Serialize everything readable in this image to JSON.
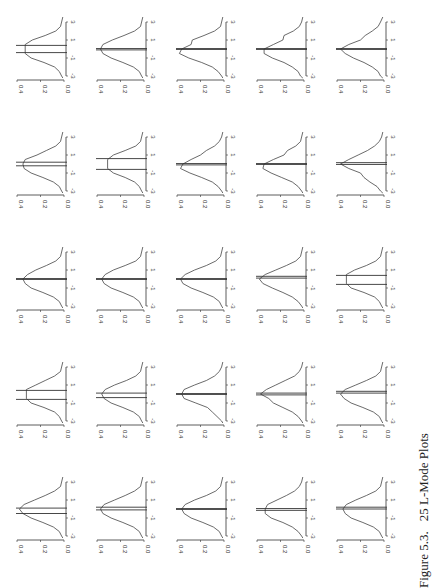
{
  "page": {
    "orientation": "rotated-90-ccw",
    "caption": {
      "figure_number": "Figure 5.3.",
      "title": "25 L-Mode Plots"
    }
  },
  "chart_data": {
    "type": "line",
    "title": "25 L-Mode Plots",
    "layout": "5x5 grid of small density plots with interval lines",
    "xlabel": "",
    "ylabel": "",
    "x_ticks": [
      "-3",
      "-1",
      "1",
      "3"
    ],
    "y_ticks": [
      "0.0",
      "0.2",
      "0.4"
    ],
    "xlim": [
      -3,
      3
    ],
    "ylim": [
      0,
      0.4
    ],
    "grid": false,
    "x_grid_points": [
      -3,
      -2.5,
      -2,
      -1.5,
      -1,
      -0.5,
      0,
      0.5,
      1,
      1.5,
      2,
      2.5,
      3
    ],
    "panels": [
      {
        "row": 0,
        "col": 0,
        "density": [
          0.02,
          0.04,
          0.08,
          0.17,
          0.28,
          0.33,
          0.33,
          0.33,
          0.27,
          0.16,
          0.07,
          0.03,
          0.02
        ],
        "interval": [
          -0.4,
          0.4
        ]
      },
      {
        "row": 0,
        "col": 1,
        "density": [
          0.02,
          0.04,
          0.09,
          0.18,
          0.28,
          0.35,
          0.37,
          0.35,
          0.27,
          0.17,
          0.08,
          0.03,
          0.02
        ],
        "interval": [
          -0.1,
          0.05
        ]
      },
      {
        "row": 0,
        "col": 2,
        "density": [
          0.02,
          0.05,
          0.1,
          0.19,
          0.3,
          0.38,
          0.36,
          0.28,
          0.27,
          0.17,
          0.08,
          0.03,
          0.02
        ],
        "interval": [
          -0.05,
          0.05
        ]
      },
      {
        "row": 0,
        "col": 3,
        "density": [
          0.03,
          0.05,
          0.1,
          0.17,
          0.27,
          0.34,
          0.34,
          0.26,
          0.18,
          0.17,
          0.09,
          0.04,
          0.02
        ],
        "interval": [
          -0.05,
          0.05
        ]
      },
      {
        "row": 0,
        "col": 4,
        "density": [
          0.03,
          0.05,
          0.1,
          0.17,
          0.26,
          0.33,
          0.37,
          0.3,
          0.2,
          0.16,
          0.1,
          0.05,
          0.03
        ],
        "interval": [
          -0.05,
          0.05
        ]
      },
      {
        "row": 1,
        "col": 0,
        "density": [
          0.02,
          0.04,
          0.09,
          0.18,
          0.28,
          0.34,
          0.35,
          0.33,
          0.23,
          0.15,
          0.07,
          0.03,
          0.02
        ],
        "interval": [
          -0.2,
          0.2
        ]
      },
      {
        "row": 1,
        "col": 1,
        "density": [
          0.02,
          0.04,
          0.08,
          0.16,
          0.26,
          0.31,
          0.31,
          0.31,
          0.26,
          0.16,
          0.07,
          0.03,
          0.02
        ],
        "interval": [
          -0.6,
          0.6
        ]
      },
      {
        "row": 1,
        "col": 2,
        "density": [
          0.02,
          0.05,
          0.1,
          0.19,
          0.29,
          0.37,
          0.35,
          0.28,
          0.2,
          0.15,
          0.08,
          0.04,
          0.02
        ],
        "interval": [
          -0.1,
          0.05
        ]
      },
      {
        "row": 1,
        "col": 3,
        "density": [
          0.02,
          0.05,
          0.1,
          0.19,
          0.28,
          0.35,
          0.34,
          0.26,
          0.17,
          0.14,
          0.07,
          0.03,
          0.02
        ],
        "interval": [
          -0.05,
          0.05
        ]
      },
      {
        "row": 1,
        "col": 4,
        "density": [
          0.03,
          0.06,
          0.12,
          0.17,
          0.2,
          0.3,
          0.37,
          0.3,
          0.22,
          0.14,
          0.08,
          0.04,
          0.02
        ],
        "interval": [
          -0.05,
          0.15
        ]
      },
      {
        "row": 2,
        "col": 0,
        "density": [
          0.02,
          0.04,
          0.09,
          0.18,
          0.28,
          0.33,
          0.35,
          0.31,
          0.24,
          0.15,
          0.07,
          0.03,
          0.02
        ],
        "interval": [
          -0.05,
          0.05
        ]
      },
      {
        "row": 2,
        "col": 1,
        "density": [
          0.02,
          0.04,
          0.09,
          0.18,
          0.28,
          0.34,
          0.36,
          0.33,
          0.26,
          0.16,
          0.07,
          0.03,
          0.02
        ],
        "interval": [
          -0.05,
          0.05
        ]
      },
      {
        "row": 2,
        "col": 2,
        "density": [
          0.02,
          0.04,
          0.09,
          0.18,
          0.28,
          0.35,
          0.37,
          0.33,
          0.25,
          0.15,
          0.07,
          0.03,
          0.02
        ],
        "interval": [
          -0.05,
          0.05
        ]
      },
      {
        "row": 2,
        "col": 3,
        "density": [
          0.02,
          0.05,
          0.1,
          0.18,
          0.27,
          0.35,
          0.38,
          0.33,
          0.24,
          0.15,
          0.07,
          0.03,
          0.02
        ],
        "interval": [
          0.1,
          0.3
        ]
      },
      {
        "row": 2,
        "col": 4,
        "density": [
          0.02,
          0.04,
          0.08,
          0.17,
          0.28,
          0.32,
          0.32,
          0.32,
          0.25,
          0.15,
          0.07,
          0.03,
          0.02
        ],
        "interval": [
          -0.6,
          0.4
        ]
      },
      {
        "row": 3,
        "col": 0,
        "density": [
          0.02,
          0.04,
          0.08,
          0.17,
          0.28,
          0.32,
          0.32,
          0.32,
          0.24,
          0.16,
          0.08,
          0.03,
          0.02
        ],
        "interval": [
          -0.6,
          0.4
        ]
      },
      {
        "row": 3,
        "col": 1,
        "density": [
          0.02,
          0.04,
          0.09,
          0.18,
          0.28,
          0.34,
          0.36,
          0.33,
          0.25,
          0.15,
          0.07,
          0.03,
          0.02
        ],
        "interval": [
          -0.4,
          0.1
        ]
      },
      {
        "row": 3,
        "col": 2,
        "density": [
          0.02,
          0.06,
          0.1,
          0.14,
          0.24,
          0.34,
          0.36,
          0.34,
          0.25,
          0.15,
          0.08,
          0.04,
          0.02
        ],
        "interval": [
          -0.05,
          0.05
        ]
      },
      {
        "row": 3,
        "col": 3,
        "density": [
          0.02,
          0.05,
          0.1,
          0.18,
          0.26,
          0.3,
          0.37,
          0.32,
          0.24,
          0.16,
          0.08,
          0.04,
          0.02
        ],
        "interval": [
          -0.1,
          0.1
        ]
      },
      {
        "row": 3,
        "col": 4,
        "density": [
          0.02,
          0.04,
          0.09,
          0.18,
          0.28,
          0.34,
          0.37,
          0.33,
          0.24,
          0.15,
          0.07,
          0.03,
          0.02
        ],
        "interval": [
          0.1,
          0.3
        ]
      },
      {
        "row": 4,
        "col": 0,
        "density": [
          0.02,
          0.04,
          0.09,
          0.18,
          0.28,
          0.35,
          0.38,
          0.34,
          0.25,
          0.16,
          0.08,
          0.03,
          0.02
        ],
        "interval": [
          -0.5,
          0.1
        ]
      },
      {
        "row": 4,
        "col": 1,
        "density": [
          0.02,
          0.04,
          0.09,
          0.18,
          0.28,
          0.35,
          0.37,
          0.34,
          0.25,
          0.16,
          0.08,
          0.03,
          0.02
        ],
        "interval": [
          -0.1,
          0.2
        ]
      },
      {
        "row": 4,
        "col": 2,
        "density": [
          0.02,
          0.04,
          0.09,
          0.18,
          0.28,
          0.34,
          0.36,
          0.33,
          0.25,
          0.15,
          0.07,
          0.03,
          0.02
        ],
        "interval": [
          -0.05,
          0.05
        ]
      },
      {
        "row": 4,
        "col": 3,
        "density": [
          0.02,
          0.05,
          0.1,
          0.18,
          0.28,
          0.33,
          0.33,
          0.31,
          0.23,
          0.15,
          0.08,
          0.04,
          0.02
        ],
        "interval": [
          -0.15,
          0.05
        ]
      },
      {
        "row": 4,
        "col": 4,
        "density": [
          0.02,
          0.04,
          0.09,
          0.18,
          0.28,
          0.33,
          0.35,
          0.32,
          0.24,
          0.15,
          0.07,
          0.03,
          0.02
        ],
        "interval": [
          0.0,
          0.2
        ]
      }
    ]
  }
}
